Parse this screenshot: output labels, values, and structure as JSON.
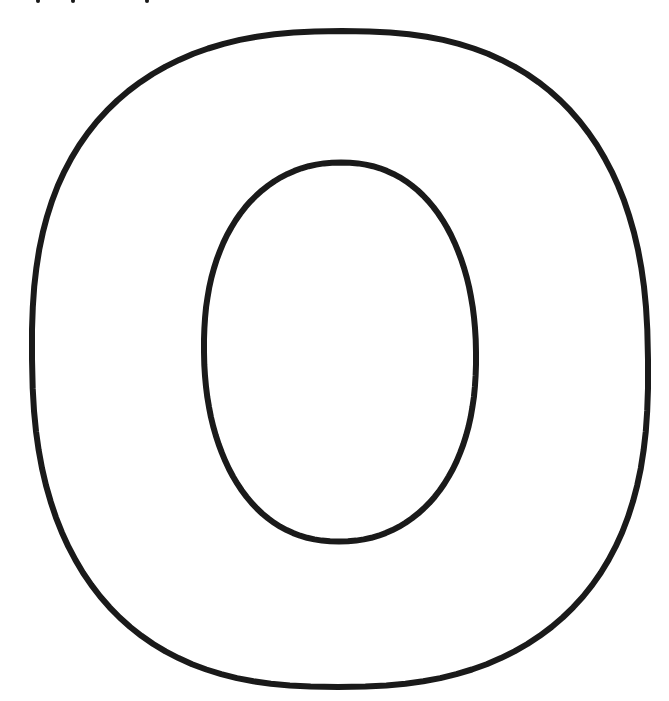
{
  "figure": {
    "background_color": "#ffffff",
    "stroke_color": "#1a1a1a",
    "stroke_width": 6,
    "outer_shape": {
      "cx": 340,
      "cy": 359,
      "rx": 308,
      "ry": 329
    },
    "inner_shape": {
      "cx": 340,
      "cy": 352,
      "rx": 136,
      "ry": 190
    },
    "top_edge_marks": [
      {
        "x": 38,
        "y": 1
      },
      {
        "x": 73,
        "y": 1
      },
      {
        "x": 147,
        "y": 1
      }
    ]
  }
}
